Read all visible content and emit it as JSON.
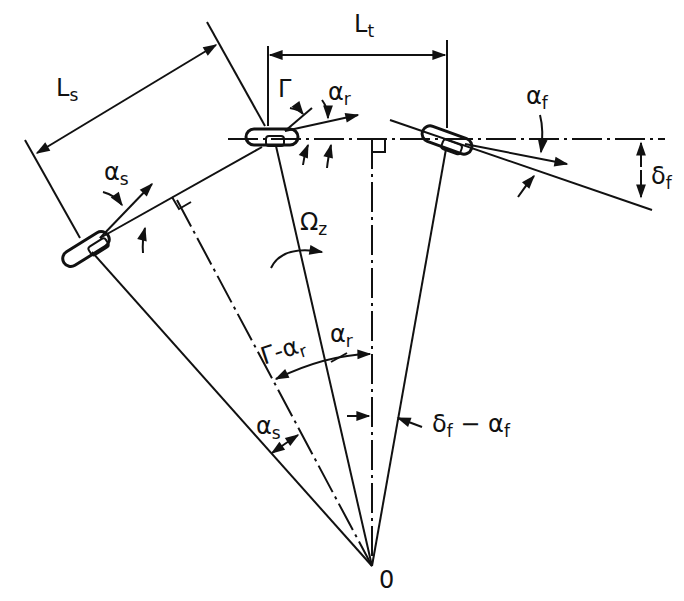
{
  "diagram": {
    "type": "vehicle turning kinematics (tractor-semitrailer)",
    "colors": {
      "ink": "#111111",
      "background": "#ffffff"
    },
    "labels": {
      "Ls": {
        "main": "L",
        "sub": "s"
      },
      "Lt": {
        "main": "L",
        "sub": "t"
      },
      "Gamma": {
        "main": "Γ",
        "sub": ""
      },
      "alpha_r_top": {
        "main": "α",
        "sub": "r"
      },
      "alpha_f": {
        "main": "α",
        "sub": "f"
      },
      "delta_f": {
        "main": "δ",
        "sub": "f"
      },
      "alpha_s_top": {
        "main": "α",
        "sub": "s"
      },
      "Omega_z": {
        "main": "Ω",
        "sub": "z"
      },
      "gamma_minus_alpha_r": {
        "main": "Γ-α",
        "sub": "r"
      },
      "alpha_r_bottom": {
        "main": "α",
        "sub": "r"
      },
      "alpha_s_bottom": {
        "main": "α",
        "sub": "s"
      },
      "delta_f_minus_alpha_f": {
        "main": "δ",
        "sub": "f",
        "tail": " − α",
        "tail_sub": "f"
      },
      "origin": {
        "main": "0"
      }
    },
    "nodes": [
      {
        "name": "front-wheel",
        "x": 447,
        "y": 140
      },
      {
        "name": "rear-wheel-hitch",
        "x": 272,
        "y": 138
      },
      {
        "name": "trailer-wheel",
        "x": 85,
        "y": 248
      },
      {
        "name": "turn-center",
        "x": 372,
        "y": 566
      }
    ]
  }
}
